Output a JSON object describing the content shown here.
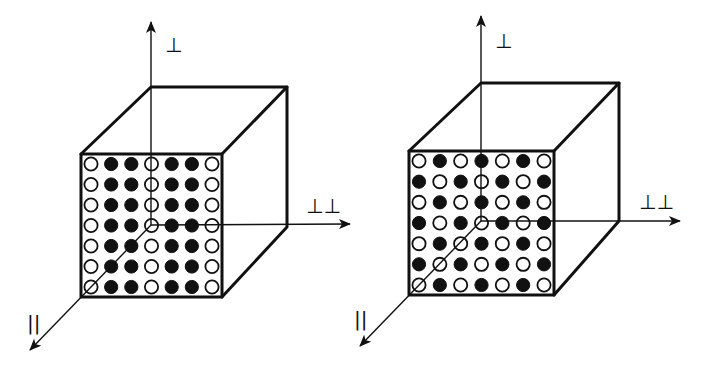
{
  "figure": {
    "background": "#ffffff",
    "ink_color": "#111111",
    "cubes": [
      {
        "id": "left",
        "front": {
          "x1": 81,
          "y1": 154,
          "x2": 222,
          "y2": 297
        },
        "back": {
          "x1": 151,
          "y1": 87,
          "x2": 287,
          "y2": 227
        },
        "origin": {
          "x": 151,
          "y": 225
        },
        "axes": {
          "perpendicular": {
            "tip": {
              "x": 151,
              "y": 22
            },
            "label": "⊥",
            "label_pos": {
              "x": 165,
              "y": 52
            }
          },
          "double_perpendicular": {
            "tip": {
              "x": 350,
              "y": 224
            },
            "label": "⊥⊥",
            "label_pos": {
              "x": 306,
              "y": 213
            }
          },
          "parallel": {
            "tip": {
              "x": 30,
              "y": 350
            },
            "label": "||",
            "label_pos": {
              "x": 27,
              "y": 330
            }
          }
        },
        "grid_pattern": [
          [
            0,
            1,
            1,
            0,
            1,
            1,
            0
          ],
          [
            0,
            1,
            1,
            0,
            1,
            1,
            0
          ],
          [
            0,
            1,
            1,
            0,
            1,
            1,
            0
          ],
          [
            0,
            1,
            1,
            0,
            1,
            1,
            0
          ],
          [
            0,
            1,
            1,
            0,
            1,
            1,
            0
          ],
          [
            0,
            1,
            1,
            0,
            1,
            1,
            0
          ],
          [
            0,
            1,
            1,
            0,
            1,
            1,
            0
          ]
        ]
      },
      {
        "id": "right",
        "front": {
          "x1": 409,
          "y1": 151,
          "x2": 554,
          "y2": 295
        },
        "back": {
          "x1": 481,
          "y1": 83,
          "x2": 619,
          "y2": 221
        },
        "origin": {
          "x": 481,
          "y": 221
        },
        "axes": {
          "perpendicular": {
            "tip": {
              "x": 481,
              "y": 16
            },
            "label": "⊥",
            "label_pos": {
              "x": 495,
              "y": 48
            }
          },
          "double_perpendicular": {
            "tip": {
              "x": 680,
              "y": 221
            },
            "label": "⊥⊥",
            "label_pos": {
              "x": 639,
              "y": 209
            }
          },
          "parallel": {
            "tip": {
              "x": 360,
              "y": 346
            },
            "label": "||",
            "label_pos": {
              "x": 354,
              "y": 326
            }
          }
        },
        "grid_pattern": [
          [
            0,
            1,
            0,
            1,
            0,
            1,
            0
          ],
          [
            1,
            0,
            1,
            0,
            1,
            0,
            1
          ],
          [
            0,
            1,
            0,
            1,
            0,
            1,
            0
          ],
          [
            1,
            0,
            1,
            0,
            1,
            0,
            1
          ],
          [
            0,
            1,
            0,
            1,
            0,
            1,
            0
          ],
          [
            1,
            0,
            1,
            0,
            1,
            0,
            1
          ],
          [
            0,
            1,
            0,
            1,
            0,
            1,
            0
          ]
        ]
      }
    ],
    "legend": {
      "filled": "filled circle",
      "open": "open circle"
    }
  }
}
